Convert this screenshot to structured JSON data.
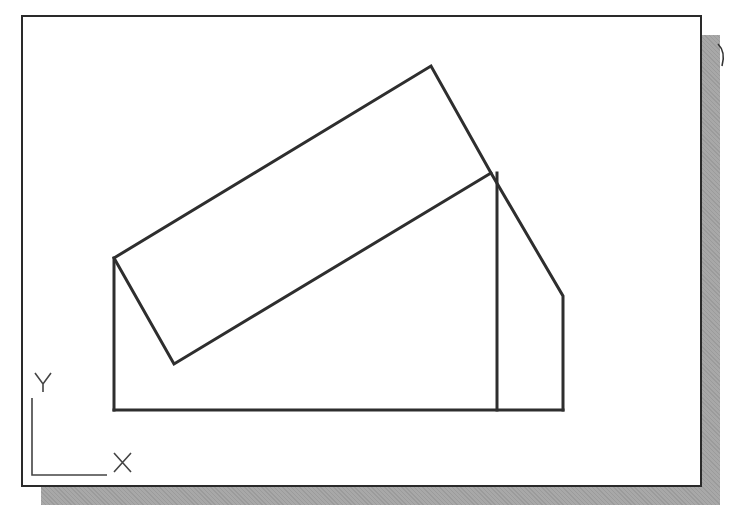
{
  "canvas": {
    "background": "#ffffff",
    "frame_color": "#2a2a2a",
    "shadow_color": "#a8a8a8",
    "line_color": "#2e2e2e"
  },
  "ucs_icon": {
    "y_label": "Y",
    "x_label": "X"
  },
  "overflow_glyph": "X",
  "geometry": {
    "tilted_rectangle": [
      [
        114,
        258
      ],
      [
        431,
        66
      ],
      [
        491,
        173
      ],
      [
        174,
        364
      ]
    ],
    "left_edge": [
      [
        114,
        258
      ],
      [
        114,
        410
      ]
    ],
    "base_line": [
      [
        114,
        410
      ],
      [
        563,
        410
      ]
    ],
    "inner_vertical": [
      [
        497,
        173
      ],
      [
        497,
        410
      ]
    ],
    "right_profile": [
      [
        491,
        173
      ],
      [
        563,
        296
      ],
      [
        563,
        410
      ]
    ]
  }
}
